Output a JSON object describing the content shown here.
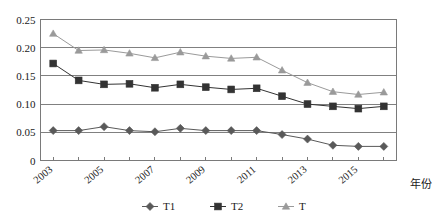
{
  "chart_data": {
    "type": "line",
    "title": "",
    "subtitle": "",
    "xlabel": "年份",
    "ylabel": "",
    "x": [
      2003,
      2004,
      2005,
      2006,
      2007,
      2008,
      2009,
      2010,
      2011,
      2012,
      2013,
      2014,
      2015,
      2016
    ],
    "categories": [
      "2003",
      "2004",
      "2005",
      "2006",
      "2007",
      "2008",
      "2009",
      "2010",
      "2011",
      "2012",
      "2013",
      "2014",
      "2015",
      "2016"
    ],
    "xtick_labels": [
      "2003",
      "2005",
      "2007",
      "2009",
      "2011",
      "2013",
      "2015"
    ],
    "xtick_values": [
      2003,
      2005,
      2007,
      2009,
      2011,
      2013,
      2015
    ],
    "ytick_labels": [
      "0",
      "0.05",
      "0.10",
      "0.15",
      "0.20",
      "0.25"
    ],
    "ytick_values": [
      0,
      0.05,
      0.1,
      0.15,
      0.2,
      0.25
    ],
    "ylim": [
      0,
      0.25
    ],
    "xlim": [
      2002.5,
      2016.5
    ],
    "grid": "horizontal",
    "legend_position": "bottom",
    "series": [
      {
        "name": "T1",
        "marker": "diamond",
        "color": "#595959",
        "values": [
          0.053,
          0.053,
          0.06,
          0.053,
          0.051,
          0.057,
          0.053,
          0.053,
          0.053,
          0.046,
          0.038,
          0.027,
          0.025,
          0.025
        ]
      },
      {
        "name": "T2",
        "marker": "square",
        "color": "#333333",
        "values": [
          0.172,
          0.142,
          0.135,
          0.136,
          0.129,
          0.135,
          0.13,
          0.126,
          0.128,
          0.114,
          0.1,
          0.096,
          0.092,
          0.096
        ]
      },
      {
        "name": "T",
        "marker": "triangle",
        "color": "#9a9a9a",
        "values": [
          0.225,
          0.195,
          0.196,
          0.19,
          0.182,
          0.192,
          0.185,
          0.181,
          0.183,
          0.16,
          0.138,
          0.122,
          0.117,
          0.121
        ]
      }
    ]
  },
  "legend": {
    "items": [
      {
        "label": "T1"
      },
      {
        "label": "T2"
      },
      {
        "label": "T"
      }
    ]
  },
  "axes": {
    "x_axis_title": "年份"
  }
}
